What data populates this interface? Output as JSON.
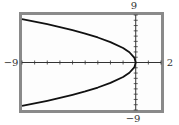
{
  "chart_data": {
    "type": "line",
    "title": "",
    "xlabel": "",
    "ylabel": "",
    "xlim": [
      -9,
      2
    ],
    "ylim": [
      -9,
      9
    ],
    "xscale": 1,
    "yscale": 1,
    "grid": false,
    "window_labels": {
      "xmin": "−9",
      "xmax": "2",
      "ymin": "−9",
      "ymax": "9"
    },
    "series": [
      {
        "name": "sideways parabola (opens left, vertex at origin)",
        "equation": "y² ≈ −7.5x",
        "points": [
          [
            -9,
            8.22
          ],
          [
            -8,
            7.75
          ],
          [
            -7,
            7.25
          ],
          [
            -6,
            6.71
          ],
          [
            -5,
            6.12
          ],
          [
            -4,
            5.48
          ],
          [
            -3,
            4.74
          ],
          [
            -2,
            3.87
          ],
          [
            -1,
            2.74
          ],
          [
            -0.5,
            1.94
          ],
          [
            -0.1,
            0.87
          ],
          [
            0,
            0
          ],
          [
            -0.1,
            -0.87
          ],
          [
            -0.5,
            -1.94
          ],
          [
            -1,
            -2.74
          ],
          [
            -2,
            -3.87
          ],
          [
            -3,
            -4.74
          ],
          [
            -4,
            -5.48
          ],
          [
            -5,
            -6.12
          ],
          [
            -6,
            -6.71
          ],
          [
            -7,
            -7.25
          ],
          [
            -8,
            -7.75
          ],
          [
            -9,
            -8.22
          ]
        ]
      }
    ],
    "colors": {
      "frame": "#8a8a8a",
      "curve": "#111111",
      "axes": "#333333"
    }
  }
}
